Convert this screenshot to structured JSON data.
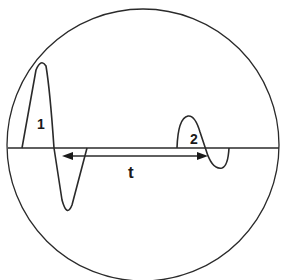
{
  "diagram": {
    "labels": {
      "echo1": "1",
      "echo2": "2",
      "interval": "t"
    },
    "colors": {
      "stroke": "#2a2a2a",
      "background": "#ffffff"
    }
  }
}
